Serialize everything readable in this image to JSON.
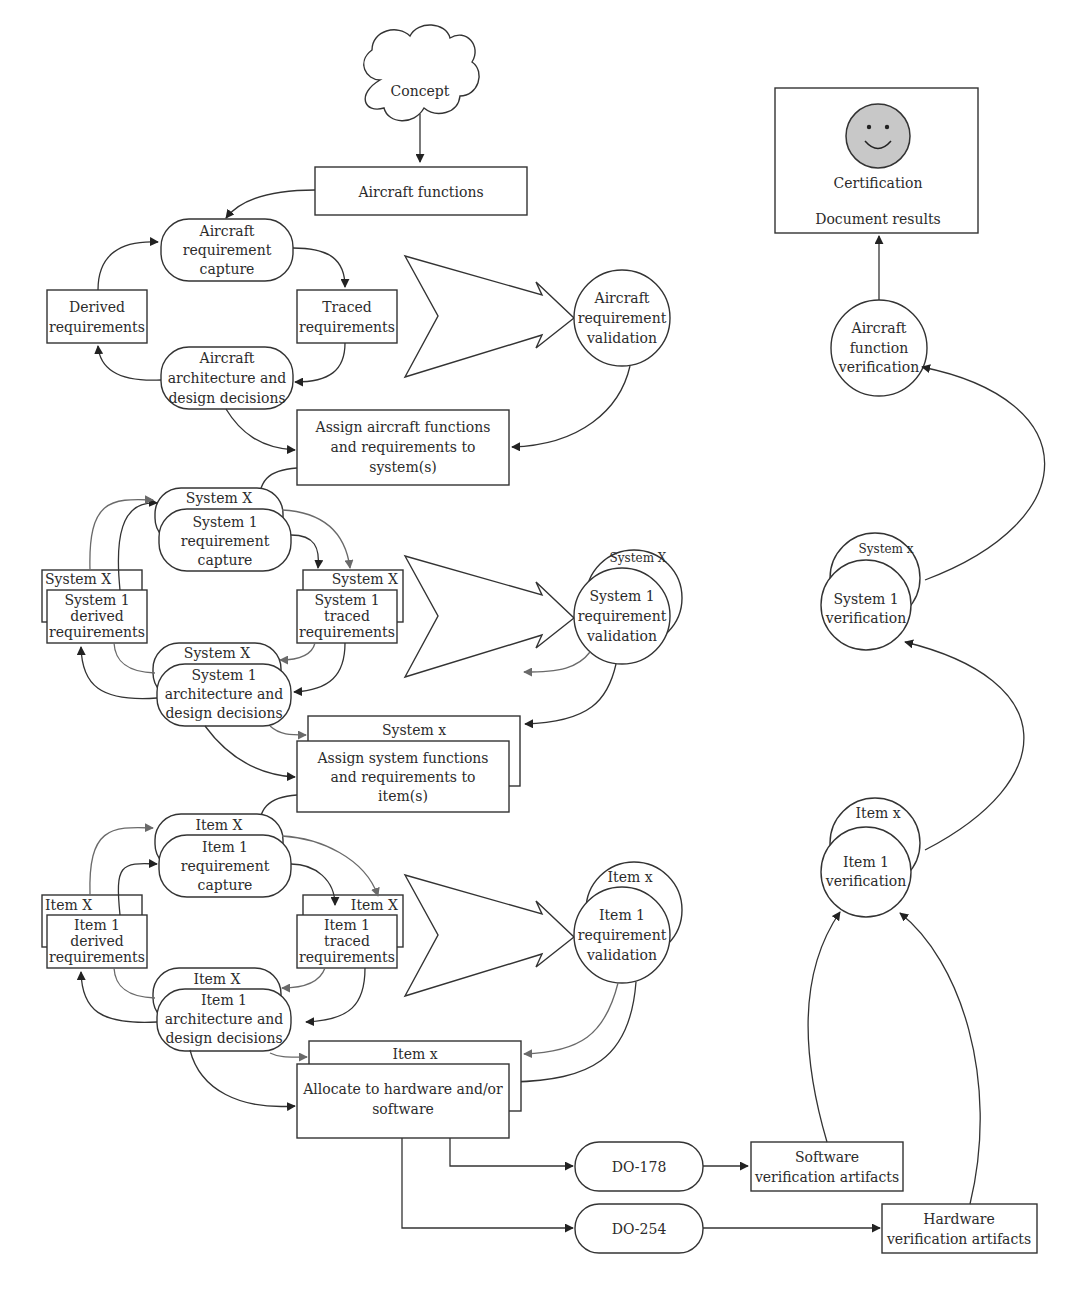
{
  "concept": "Concept",
  "aircraft_functions": "Aircraft functions",
  "aircraft_level": {
    "capture": [
      "Aircraft",
      "requirement",
      "capture"
    ],
    "derived": [
      "Derived",
      "requirements"
    ],
    "traced": [
      "Traced",
      "requirements"
    ],
    "architecture": [
      "Aircraft",
      "architecture and",
      "design decisions"
    ],
    "validation": [
      "Aircraft",
      "requirement",
      "validation"
    ],
    "assign": [
      "Assign aircraft functions",
      "and requirements to",
      "system(s)"
    ]
  },
  "system_level": {
    "stack_label": "System X",
    "capture": [
      "System 1",
      "requirement",
      "capture"
    ],
    "derived": [
      "System 1",
      "derived",
      "requirements"
    ],
    "traced": [
      "System 1",
      "traced",
      "requirements"
    ],
    "architecture": [
      "System 1",
      "architecture and",
      "design decisions"
    ],
    "validation": [
      "System 1",
      "requirement",
      "validation"
    ],
    "assign_stack_label": "System x",
    "assign": [
      "Assign system functions",
      "and requirements to",
      "item(s)"
    ]
  },
  "item_level": {
    "stack_label": "Item X",
    "capture": [
      "Item 1",
      "requirement",
      "capture"
    ],
    "derived": [
      "Item 1",
      "derived",
      "requirements"
    ],
    "traced": [
      "Item 1",
      "traced",
      "requirements"
    ],
    "architecture": [
      "Item 1",
      "architecture and",
      "design decisions"
    ],
    "validation_stack_label": "Item x",
    "validation": [
      "Item 1",
      "requirement",
      "validation"
    ],
    "allocate_stack_label": "Item x",
    "allocate": [
      "Allocate to hardware and/or",
      "software"
    ]
  },
  "standards": {
    "software": "DO-178",
    "hardware": "DO-254"
  },
  "artifacts": {
    "software": [
      "Software",
      "verification artifacts"
    ],
    "hardware": [
      "Hardware",
      "verification artifacts"
    ]
  },
  "verification": {
    "item_stack_label": "Item x",
    "item": [
      "Item 1",
      "verification"
    ],
    "system_stack_label": "System x",
    "system": [
      "System 1",
      "verification"
    ],
    "aircraft": [
      "Aircraft",
      "function",
      "verification"
    ]
  },
  "certification": {
    "icon": "smiley-face-icon",
    "label": "Certification",
    "document": "Document results",
    "face_color": "#c8c8c8"
  }
}
